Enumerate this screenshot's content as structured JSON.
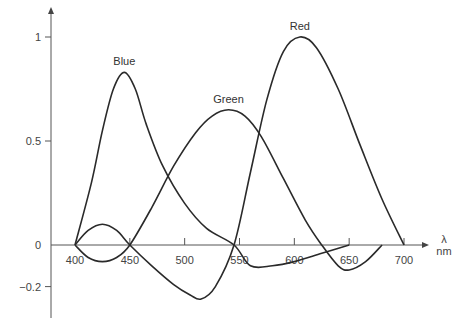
{
  "chart_data": {
    "type": "line",
    "title": "",
    "xlabel": "λ nm",
    "xlabel_symbol": "λ",
    "xlabel_unit": "nm",
    "ylabel": "",
    "xlim": [
      400,
      700
    ],
    "ylim": [
      -0.25,
      1.05
    ],
    "grid": false,
    "legend": "inline labels at curve peaks",
    "x_ticks": [
      400,
      450,
      500,
      550,
      600,
      650,
      700
    ],
    "x_tick_labels": [
      "400",
      "450",
      "500",
      "550",
      "600",
      "650",
      "700"
    ],
    "y_ticks": [
      -0.2,
      0,
      0.5,
      1
    ],
    "y_tick_labels": [
      "−0.2",
      "0",
      "0.5",
      "1"
    ],
    "series": [
      {
        "name": "Blue",
        "x": [
          400,
          415,
          425,
          435,
          445,
          455,
          465,
          480,
          500,
          520,
          545,
          560,
          580,
          600,
          625,
          650
        ],
        "values": [
          0,
          0.3,
          0.55,
          0.75,
          0.83,
          0.75,
          0.58,
          0.38,
          0.2,
          0.08,
          0,
          -0.1,
          -0.1,
          -0.08,
          -0.04,
          0
        ]
      },
      {
        "name": "Green",
        "x": [
          400,
          412,
          425,
          438,
          450,
          470,
          490,
          510,
          525,
          540,
          555,
          570,
          590,
          610,
          625,
          640,
          650,
          665,
          680
        ],
        "values": [
          0,
          -0.06,
          -0.08,
          -0.06,
          0,
          0.18,
          0.38,
          0.54,
          0.62,
          0.65,
          0.62,
          0.52,
          0.32,
          0.12,
          0,
          -0.1,
          -0.12,
          -0.08,
          0
        ]
      },
      {
        "name": "Red",
        "x": [
          400,
          412,
          425,
          438,
          450,
          470,
          490,
          505,
          515,
          528,
          545,
          560,
          575,
          590,
          605,
          620,
          640,
          660,
          680,
          700
        ],
        "values": [
          0,
          0.07,
          0.1,
          0.07,
          0,
          -0.1,
          -0.19,
          -0.24,
          -0.26,
          -0.2,
          0,
          0.35,
          0.7,
          0.93,
          1.0,
          0.95,
          0.75,
          0.48,
          0.22,
          0
        ]
      }
    ],
    "annotations": [
      {
        "text": "Blue",
        "x": 445,
        "y": 0.83
      },
      {
        "text": "Green",
        "x": 540,
        "y": 0.65
      },
      {
        "text": "Red",
        "x": 605,
        "y": 1.0
      }
    ]
  }
}
